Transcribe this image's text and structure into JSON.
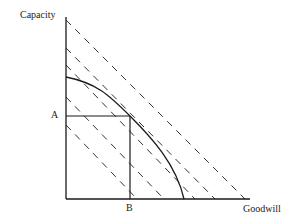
{
  "diagram": {
    "type": "production-possibility-frontier",
    "labels": {
      "y_axis": "Capacity",
      "x_axis": "Goodwill",
      "point_a": "A",
      "point_b": "B"
    },
    "colors": {
      "axis": "#1a1a1a",
      "curve": "#1a1a1a",
      "dashed": "#333333",
      "background": "#ffffff"
    },
    "geometry": {
      "origin": [
        66,
        199
      ],
      "y_axis_top": [
        66,
        17
      ],
      "x_axis_end": [
        250,
        199
      ],
      "curve": {
        "start": [
          66,
          77
        ],
        "tangent_point": [
          130,
          116
        ],
        "end": [
          184,
          199
        ]
      },
      "a_level_y": 116,
      "b_level_x": 130,
      "iso_lines": [
        {
          "y_start": 20,
          "x_end": 245
        },
        {
          "y_start": 48,
          "x_end": 215
        },
        {
          "y_start": 65,
          "x_end": 195
        },
        {
          "y_start": 97,
          "x_end": 164
        },
        {
          "y_start": 125,
          "x_end": 137
        }
      ]
    }
  }
}
